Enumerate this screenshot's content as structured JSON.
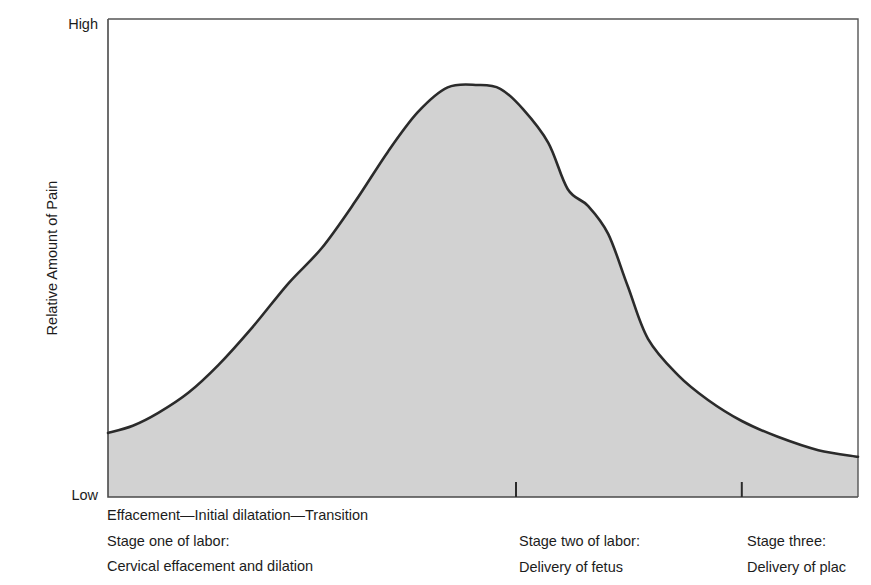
{
  "chart_data": {
    "type": "area",
    "title": "",
    "subtitle": "",
    "xlabel": "",
    "ylabel": "Relative Amount of Pain",
    "ylim": [
      0,
      100
    ],
    "xlim": [
      0,
      100
    ],
    "grid": false,
    "legend": "none",
    "y_tick_labels": [
      "Low",
      "High"
    ],
    "y_axis_title": "Relative Amount of Pain",
    "x_tick_labels": [],
    "x_tick_positions_pct": [
      54.4,
      84.5
    ],
    "series": [
      {
        "name": "Relative amount of pain",
        "fill_color": "#d2d2d2",
        "line_color": "#2b2b2b",
        "x": [
          0.0,
          3.3,
          6.7,
          10.7,
          14.7,
          19.3,
          24.0,
          28.5,
          33.0,
          37.3,
          41.3,
          45.3,
          49.3,
          52.3,
          55.3,
          58.7,
          61.3,
          64.0,
          66.7,
          69.3,
          72.0,
          76.0,
          80.0,
          84.5,
          89.3,
          94.7,
          100.0
        ],
        "y": [
          13.4,
          14.9,
          17.6,
          21.8,
          27.6,
          35.6,
          44.6,
          52.1,
          61.9,
          72.2,
          80.5,
          85.7,
          86.2,
          85.4,
          81.2,
          74.1,
          64.4,
          60.9,
          55.0,
          44.1,
          33.1,
          25.5,
          20.3,
          15.9,
          12.6,
          9.8,
          8.4
        ]
      }
    ],
    "annotations": [
      {
        "text": "Effacement—Initial dilatation—Transition",
        "position": "below-axis-left"
      },
      {
        "text": "Stage one of labor: Cervical effacement and dilation",
        "position": "below-axis-left"
      },
      {
        "text": "Stage two of labor: Delivery of fetus",
        "position": "below-axis-center"
      },
      {
        "text": "Stage three: Delivery of plac",
        "position": "below-axis-right"
      }
    ]
  },
  "axis": {
    "y_label_high": "High",
    "y_label_low": "Low",
    "y_title": "Relative Amount of Pain"
  },
  "caption": {
    "col1": {
      "line1": "Effacement—Initial dilatation—Transition",
      "line2": "Stage one of labor:",
      "line3": "Cervical effacement and dilation"
    },
    "col2": {
      "line1": "Stage two of labor:",
      "line2": "Delivery of fetus"
    },
    "col3": {
      "line1": "Stage three:",
      "line2": "Delivery of plac"
    }
  },
  "colors": {
    "area_fill": "#d2d2d2",
    "curve_line": "#2b2b2b",
    "axis_line": "#4a4a4a",
    "text": "#1c1c1c",
    "background": "#ffffff"
  }
}
